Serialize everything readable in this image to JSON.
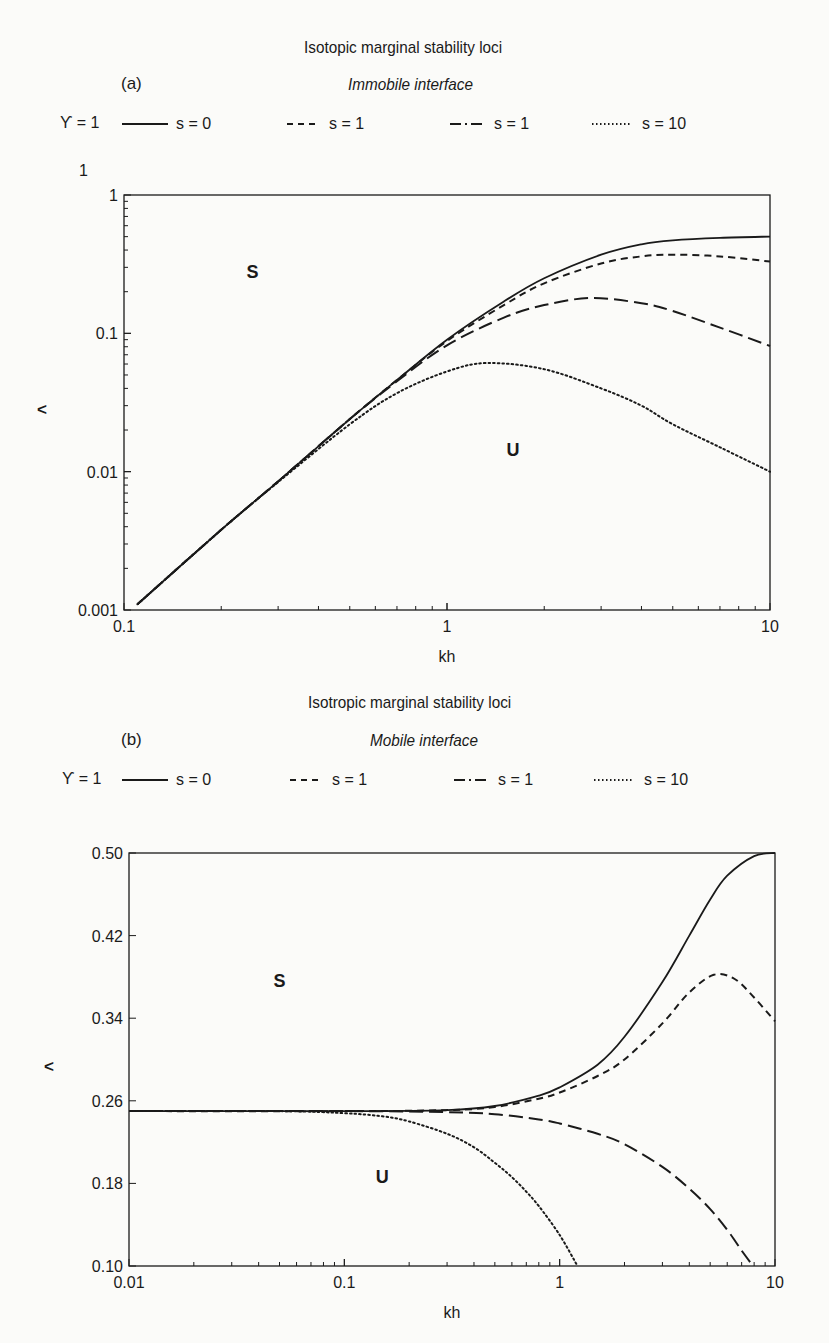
{
  "chart_data": [
    {
      "type": "line",
      "panel_label": "(a)",
      "title": "Isotopic marginal stability loci",
      "subtitle": "Immobile interface",
      "legend_prefix": "ϒ = 1",
      "legend": [
        {
          "style": "solid",
          "label": "s = 0"
        },
        {
          "style": "short-dash",
          "label": "s = 1"
        },
        {
          "style": "long-dash-dot",
          "label": "s = 1"
        },
        {
          "style": "dotted",
          "label": "s = 10"
        }
      ],
      "xlabel": "kh",
      "ylabel": "<",
      "xscale": "log",
      "yscale": "log",
      "xlim": [
        0.1,
        10
      ],
      "ylim": [
        0.001,
        1
      ],
      "xticks": [
        "0.1",
        "1",
        "10"
      ],
      "yticks": [
        "0.001",
        "0.01",
        "0.1",
        "1"
      ],
      "extra_top_label": "1",
      "region_labels": [
        {
          "text": "S",
          "x": 0.25,
          "y": 0.25
        },
        {
          "text": "U",
          "x": 1.6,
          "y": 0.013
        }
      ],
      "grid": false,
      "series": [
        {
          "name": "s = 0",
          "style": "solid",
          "x": [
            0.11,
            0.2,
            0.3,
            0.5,
            0.7,
            1.0,
            1.5,
            2.0,
            3.0,
            4.0,
            5.0,
            7.0,
            10.0
          ],
          "y": [
            0.0011,
            0.0038,
            0.0085,
            0.024,
            0.046,
            0.09,
            0.17,
            0.25,
            0.37,
            0.44,
            0.47,
            0.49,
            0.5
          ]
        },
        {
          "name": "s = 1 (short dash)",
          "style": "short-dash",
          "x": [
            0.11,
            0.2,
            0.3,
            0.5,
            0.7,
            1.0,
            1.5,
            2.0,
            3.0,
            4.0,
            5.0,
            7.0,
            10.0
          ],
          "y": [
            0.0011,
            0.0038,
            0.0085,
            0.024,
            0.046,
            0.088,
            0.16,
            0.23,
            0.32,
            0.36,
            0.37,
            0.36,
            0.33
          ]
        },
        {
          "name": "s = 1 (long dash)",
          "style": "long-dash",
          "x": [
            0.11,
            0.2,
            0.3,
            0.5,
            0.7,
            1.0,
            1.5,
            2.0,
            2.8,
            4.0,
            5.0,
            7.0,
            10.0
          ],
          "y": [
            0.0011,
            0.0038,
            0.0085,
            0.024,
            0.045,
            0.082,
            0.13,
            0.16,
            0.18,
            0.165,
            0.145,
            0.11,
            0.081
          ]
        },
        {
          "name": "s = 10",
          "style": "dotted",
          "x": [
            0.11,
            0.2,
            0.3,
            0.5,
            0.7,
            1.0,
            1.33,
            2.0,
            3.0,
            4.0,
            5.0,
            7.0,
            10.0
          ],
          "y": [
            0.0011,
            0.0038,
            0.0084,
            0.022,
            0.037,
            0.053,
            0.061,
            0.055,
            0.04,
            0.03,
            0.022,
            0.015,
            0.01
          ]
        }
      ]
    },
    {
      "type": "line",
      "panel_label": "(b)",
      "title": "Isotropic marginal stability loci",
      "subtitle": "Mobile interface",
      "legend_prefix": "ϒ = 1",
      "legend": [
        {
          "style": "solid",
          "label": "s = 0"
        },
        {
          "style": "short-dash",
          "label": "s = 1"
        },
        {
          "style": "long-dash-dot",
          "label": "s = 1"
        },
        {
          "style": "dotted",
          "label": "s = 10"
        }
      ],
      "xlabel": "kh",
      "ylabel": "<",
      "xscale": "log",
      "yscale": "linear",
      "xlim": [
        0.01,
        10
      ],
      "ylim": [
        0.1,
        0.5
      ],
      "xticks": [
        "0.01",
        "0.1",
        "1",
        "10"
      ],
      "yticks": [
        "0.10",
        "0.18",
        "0.26",
        "0.34",
        "0.42",
        "0.50"
      ],
      "region_labels": [
        {
          "text": "S",
          "x": 0.05,
          "y": 0.37
        },
        {
          "text": "U",
          "x": 0.15,
          "y": 0.18
        }
      ],
      "grid": false,
      "series": [
        {
          "name": "s = 0",
          "style": "solid",
          "x": [
            0.01,
            0.1,
            0.3,
            0.5,
            0.8,
            1.0,
            1.5,
            2.0,
            3.0,
            4.0,
            5.0,
            6.0,
            8.0,
            10.0
          ],
          "y": [
            0.25,
            0.25,
            0.251,
            0.255,
            0.265,
            0.273,
            0.295,
            0.322,
            0.375,
            0.42,
            0.455,
            0.478,
            0.497,
            0.5
          ]
        },
        {
          "name": "s = 1 (short dash)",
          "style": "short-dash",
          "x": [
            0.01,
            0.1,
            0.3,
            0.5,
            0.8,
            1.0,
            1.5,
            2.0,
            3.0,
            4.0,
            5.2,
            6.5,
            8.0,
            10.0
          ],
          "y": [
            0.25,
            0.25,
            0.251,
            0.254,
            0.262,
            0.268,
            0.284,
            0.3,
            0.335,
            0.365,
            0.382,
            0.378,
            0.36,
            0.337
          ]
        },
        {
          "name": "s = 1 (long dash)",
          "style": "long-dash",
          "x": [
            0.01,
            0.1,
            0.3,
            0.5,
            0.8,
            1.0,
            1.5,
            2.0,
            3.0,
            4.0,
            5.0,
            6.0,
            7.0,
            7.9
          ],
          "y": [
            0.25,
            0.25,
            0.249,
            0.247,
            0.242,
            0.238,
            0.228,
            0.218,
            0.196,
            0.175,
            0.155,
            0.135,
            0.115,
            0.1
          ]
        },
        {
          "name": "s = 10",
          "style": "dotted",
          "x": [
            0.01,
            0.05,
            0.1,
            0.15,
            0.2,
            0.3,
            0.4,
            0.5,
            0.6,
            0.7,
            0.8,
            1.0,
            1.21
          ],
          "y": [
            0.25,
            0.25,
            0.248,
            0.245,
            0.24,
            0.228,
            0.215,
            0.2,
            0.186,
            0.172,
            0.158,
            0.13,
            0.1
          ]
        }
      ]
    }
  ]
}
